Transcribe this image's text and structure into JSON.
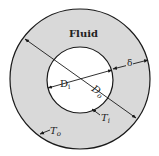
{
  "diagram": {
    "colors": {
      "background": "#ffffff",
      "annulus_fill": "#d9d9d9",
      "inner_fill": "#ffffff",
      "stroke": "#1a1a1a"
    },
    "labels": {
      "fluid": "Fluid",
      "inner_diameter": "D",
      "inner_diameter_sub": "i",
      "outer_diameter": "D",
      "outer_diameter_sub": "o",
      "gap": "δ",
      "inner_temp": "T",
      "inner_temp_sub": "i",
      "outer_temp": "T",
      "outer_temp_sub": "o"
    },
    "geometry": {
      "outer_circle": {
        "cx": 80,
        "cy": 79,
        "r": 70
      },
      "inner_circle": {
        "cx": 80,
        "cy": 80,
        "r": 33
      }
    }
  }
}
